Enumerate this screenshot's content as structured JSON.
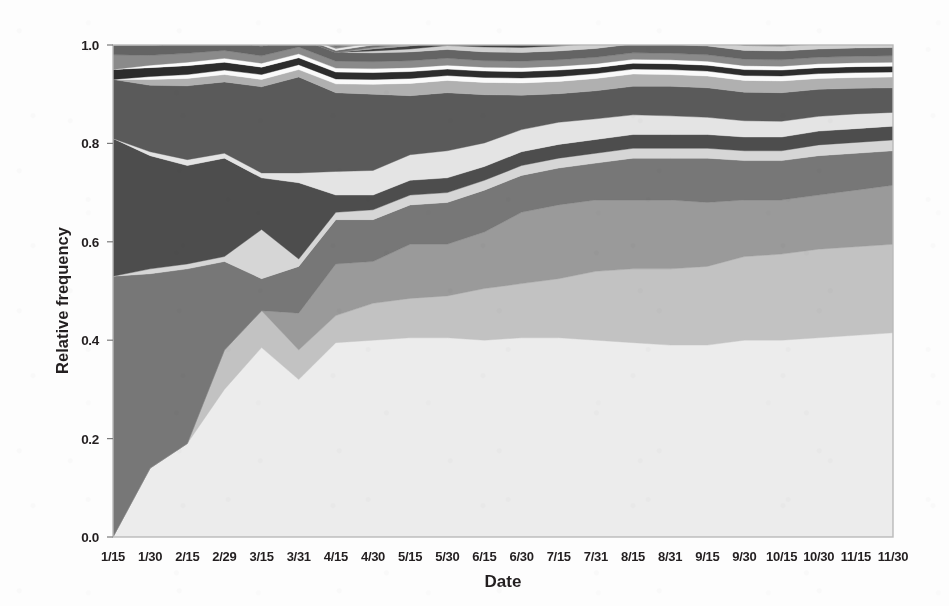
{
  "figure": {
    "background_color": "#fdfdfd",
    "plot_frame_color": "#b9b9b9"
  },
  "axes": {
    "x_label": "Date",
    "y_label": "Relative frequency",
    "y_ticks": [
      "1.0",
      "0.8",
      "0.6",
      "0.4",
      "0.2",
      "0.0"
    ],
    "x_ticks": [
      "1/15",
      "1/30",
      "2/15",
      "2/29",
      "3/15",
      "3/31",
      "4/15",
      "4/30",
      "5/15",
      "5/30",
      "6/15",
      "6/30",
      "7/15",
      "7/31",
      "8/15",
      "8/31",
      "9/15",
      "9/30",
      "10/15",
      "10/30",
      "11/15",
      "11/30"
    ]
  },
  "chart_data": {
    "type": "area",
    "stacked": true,
    "normalized": true,
    "title": "",
    "xlabel": "Date",
    "ylabel": "Relative frequency",
    "xlim": [
      0,
      21
    ],
    "ylim": [
      0.0,
      1.0
    ],
    "grid": false,
    "legend": "none",
    "categories": [
      "1/15",
      "1/30",
      "2/15",
      "2/29",
      "3/15",
      "3/31",
      "4/15",
      "4/30",
      "5/15",
      "5/30",
      "6/15",
      "6/30",
      "7/15",
      "7/31",
      "8/15",
      "8/31",
      "9/15",
      "9/30",
      "10/15",
      "10/30",
      "11/15",
      "11/30"
    ],
    "series": [
      {
        "name": "band-01",
        "color": "#ececec",
        "values": [
          0.0,
          0.14,
          0.19,
          0.3,
          0.385,
          0.32,
          0.395,
          0.4,
          0.405,
          0.405,
          0.4,
          0.405,
          0.405,
          0.4,
          0.395,
          0.39,
          0.39,
          0.4,
          0.4,
          0.405,
          0.41,
          0.415
        ]
      },
      {
        "name": "band-02",
        "color": "#c2c2c2",
        "values": [
          0.0,
          0.0,
          0.0,
          0.08,
          0.075,
          0.06,
          0.055,
          0.075,
          0.08,
          0.085,
          0.105,
          0.11,
          0.12,
          0.14,
          0.15,
          0.155,
          0.16,
          0.17,
          0.175,
          0.18,
          0.18,
          0.18
        ]
      },
      {
        "name": "band-03",
        "color": "#9a9a9a",
        "values": [
          0.0,
          0.0,
          0.0,
          0.0,
          0.0,
          0.075,
          0.105,
          0.085,
          0.11,
          0.105,
          0.115,
          0.145,
          0.15,
          0.145,
          0.14,
          0.14,
          0.13,
          0.115,
          0.11,
          0.11,
          0.115,
          0.12
        ]
      },
      {
        "name": "band-04",
        "color": "#777777",
        "values": [
          0.53,
          0.395,
          0.355,
          0.18,
          0.065,
          0.095,
          0.09,
          0.085,
          0.08,
          0.085,
          0.085,
          0.075,
          0.075,
          0.075,
          0.085,
          0.085,
          0.09,
          0.08,
          0.08,
          0.08,
          0.075,
          0.07
        ]
      },
      {
        "name": "band-05",
        "color": "#d6d6d6",
        "values": [
          0.0,
          0.01,
          0.01,
          0.01,
          0.1,
          0.015,
          0.015,
          0.02,
          0.02,
          0.02,
          0.02,
          0.02,
          0.02,
          0.02,
          0.02,
          0.02,
          0.02,
          0.02,
          0.02,
          0.022,
          0.022,
          0.022
        ]
      },
      {
        "name": "band-06",
        "color": "#4d4d4d",
        "values": [
          0.28,
          0.23,
          0.2,
          0.2,
          0.105,
          0.155,
          0.035,
          0.03,
          0.03,
          0.03,
          0.028,
          0.028,
          0.028,
          0.028,
          0.028,
          0.028,
          0.028,
          0.028,
          0.028,
          0.028,
          0.028,
          0.028
        ]
      },
      {
        "name": "band-07",
        "color": "#e4e4e4",
        "values": [
          0.0,
          0.008,
          0.012,
          0.01,
          0.01,
          0.02,
          0.048,
          0.05,
          0.052,
          0.055,
          0.048,
          0.045,
          0.045,
          0.042,
          0.04,
          0.038,
          0.035,
          0.033,
          0.032,
          0.03,
          0.03,
          0.028
        ]
      },
      {
        "name": "band-08",
        "color": "#5a5a5a",
        "values": [
          0.12,
          0.135,
          0.15,
          0.145,
          0.175,
          0.195,
          0.16,
          0.155,
          0.12,
          0.118,
          0.098,
          0.07,
          0.058,
          0.057,
          0.058,
          0.06,
          0.06,
          0.058,
          0.058,
          0.055,
          0.052,
          0.05
        ]
      },
      {
        "name": "band-09",
        "color": "#b0b0b0",
        "values": [
          0.0,
          0.012,
          0.015,
          0.015,
          0.015,
          0.015,
          0.018,
          0.02,
          0.025,
          0.025,
          0.025,
          0.025,
          0.025,
          0.025,
          0.025,
          0.024,
          0.024,
          0.024,
          0.024,
          0.022,
          0.022,
          0.022
        ]
      },
      {
        "name": "band-10",
        "color": "#fafafa",
        "values": [
          0.0,
          0.006,
          0.008,
          0.009,
          0.01,
          0.01,
          0.01,
          0.01,
          0.01,
          0.01,
          0.01,
          0.01,
          0.01,
          0.01,
          0.01,
          0.01,
          0.01,
          0.01,
          0.01,
          0.01,
          0.01,
          0.01
        ]
      },
      {
        "name": "band-11",
        "color": "#2c2c2c",
        "values": [
          0.02,
          0.018,
          0.018,
          0.016,
          0.015,
          0.014,
          0.014,
          0.014,
          0.014,
          0.013,
          0.013,
          0.013,
          0.013,
          0.012,
          0.012,
          0.012,
          0.012,
          0.012,
          0.012,
          0.012,
          0.012,
          0.012
        ]
      },
      {
        "name": "band-12",
        "color": "#fcfcfc",
        "values": [
          0.0,
          0.005,
          0.007,
          0.008,
          0.008,
          0.008,
          0.008,
          0.008,
          0.008,
          0.008,
          0.008,
          0.008,
          0.008,
          0.008,
          0.008,
          0.008,
          0.008,
          0.008,
          0.008,
          0.008,
          0.008,
          0.008
        ]
      },
      {
        "name": "band-13",
        "color": "#8a8a8a",
        "values": [
          0.03,
          0.02,
          0.018,
          0.016,
          0.015,
          0.014,
          0.014,
          0.014,
          0.014,
          0.014,
          0.013,
          0.013,
          0.013,
          0.013,
          0.013,
          0.013,
          0.013,
          0.013,
          0.013,
          0.013,
          0.013,
          0.013
        ]
      },
      {
        "name": "band-14",
        "color": "#646464",
        "values": [
          0.02,
          0.021,
          0.02,
          0.02,
          0.02,
          0.018,
          0.018,
          0.018,
          0.018,
          0.018,
          0.018,
          0.018,
          0.018,
          0.018,
          0.018,
          0.018,
          0.018,
          0.018,
          0.018,
          0.017,
          0.017,
          0.017
        ]
      },
      {
        "name": "band-15",
        "color": "#d0d0d0",
        "values": [
          0.0,
          0.0,
          0.0,
          0.0,
          0.0,
          0.0,
          0.0,
          0.004,
          0.006,
          0.008,
          0.01,
          0.01,
          0.01,
          0.01,
          0.01,
          0.01,
          0.01,
          0.01,
          0.01,
          0.01,
          0.01,
          0.01
        ]
      },
      {
        "name": "band-16",
        "color": "#414141",
        "values": [
          0.0,
          0.0,
          0.0,
          0.0,
          0.0,
          0.0,
          0.0,
          0.004,
          0.006,
          0.008,
          0.008,
          0.008,
          0.008,
          0.008,
          0.008,
          0.008,
          0.008,
          0.008,
          0.008,
          0.008,
          0.008,
          0.008
        ]
      },
      {
        "name": "band-17",
        "color": "#a5a5a5",
        "values": [
          0.0,
          0.0,
          0.0,
          0.0,
          0.0,
          0.0,
          0.0,
          0.003,
          0.004,
          0.005,
          0.006,
          0.006,
          0.006,
          0.006,
          0.006,
          0.006,
          0.006,
          0.006,
          0.006,
          0.006,
          0.006,
          0.006
        ]
      },
      {
        "name": "band-18",
        "color": "#707070",
        "values": [
          0.0,
          0.0,
          0.0,
          0.0,
          0.002,
          0.003,
          0.004,
          0.005,
          0.005,
          0.005,
          0.005,
          0.005,
          0.005,
          0.005,
          0.005,
          0.005,
          0.005,
          0.005,
          0.005,
          0.005,
          0.005,
          0.005
        ]
      },
      {
        "name": "band-19",
        "color": "#e8e8e8",
        "values": [
          0.0,
          0.0,
          0.0,
          0.0,
          0.002,
          0.003,
          0.004,
          0.004,
          0.004,
          0.004,
          0.004,
          0.004,
          0.004,
          0.004,
          0.004,
          0.004,
          0.004,
          0.004,
          0.004,
          0.004,
          0.004,
          0.004
        ]
      },
      {
        "name": "band-20",
        "color": "#868686",
        "values": [
          0.0,
          0.0,
          0.0,
          0.0,
          0.003,
          0.004,
          0.004,
          0.004,
          0.004,
          0.004,
          0.004,
          0.004,
          0.004,
          0.004,
          0.004,
          0.004,
          0.004,
          0.004,
          0.004,
          0.004,
          0.004,
          0.004
        ]
      },
      {
        "name": "band-21",
        "color": "#585858",
        "values": [
          0.0,
          0.0,
          0.002,
          0.003,
          0.003,
          0.003,
          0.003,
          0.003,
          0.003,
          0.003,
          0.003,
          0.003,
          0.003,
          0.003,
          0.003,
          0.003,
          0.003,
          0.003,
          0.003,
          0.003,
          0.003,
          0.003
        ]
      },
      {
        "name": "band-22",
        "color": "#9e9e9e",
        "values": [
          0.0,
          0.0,
          0.0,
          0.0,
          0.002,
          0.002,
          0.002,
          0.002,
          0.002,
          0.002,
          0.002,
          0.002,
          0.002,
          0.002,
          0.002,
          0.002,
          0.002,
          0.002,
          0.002,
          0.002,
          0.002,
          0.002
        ]
      }
    ]
  }
}
